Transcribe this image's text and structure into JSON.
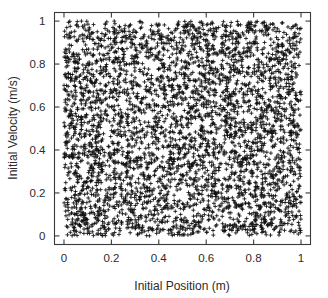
{
  "figure": {
    "background_color": "#ffffff",
    "frame_color": "#3a3a3a",
    "marker_color": "#111111"
  },
  "chart_data": {
    "type": "scatter",
    "title": "",
    "subtitle": "",
    "xlabel": "Initial Position (m)",
    "ylabel": "Initial Velocity (m/s)",
    "xlim": [
      -0.04,
      1.04
    ],
    "ylim": [
      -0.04,
      1.04
    ],
    "xticks": [
      0,
      0.2,
      0.4,
      0.6,
      0.8,
      1
    ],
    "yticks": [
      0,
      0.2,
      0.4,
      0.6,
      0.8,
      1
    ],
    "xticklabels": [
      "0",
      "0.2",
      "0.4",
      "0.6",
      "0.8",
      "1"
    ],
    "yticklabels": [
      "0",
      "0.2",
      "0.4",
      "0.6",
      "0.8",
      "1"
    ],
    "grid": false,
    "legend": null,
    "marker": "plus",
    "marker_size": 4,
    "n_points": 4000,
    "distribution": "uniform-random",
    "x_range": [
      0.0,
      1.0
    ],
    "y_range": [
      0.0,
      1.0
    ],
    "annotations": []
  },
  "axes": {
    "x_label": "Initial Position (m)",
    "y_label": "Initial Velocity (m/s)",
    "tick_labels_x": [
      "0",
      "0.2",
      "0.4",
      "0.6",
      "0.8",
      "1"
    ],
    "tick_labels_y": [
      "0",
      "0.2",
      "0.4",
      "0.6",
      "0.8",
      "1"
    ]
  }
}
